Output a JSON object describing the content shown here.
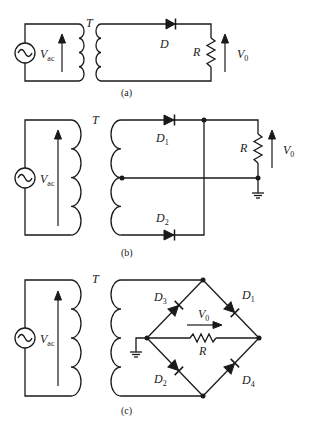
{
  "figure": {
    "panels": [
      {
        "id": "a",
        "caption": "(a)",
        "title": "Half-wave rectifier",
        "labels": {
          "source": "V",
          "source_sub": "ac",
          "transformer": "T",
          "diode": "D",
          "resistor": "R",
          "output": "V",
          "output_sub": "0"
        }
      },
      {
        "id": "b",
        "caption": "(b)",
        "title": "Center-tapped full-wave rectifier",
        "labels": {
          "source": "V",
          "source_sub": "ac",
          "transformer": "T",
          "diode1": "D",
          "diode1_sub": "1",
          "diode2": "D",
          "diode2_sub": "2",
          "resistor": "R",
          "output": "V",
          "output_sub": "0"
        }
      },
      {
        "id": "c",
        "caption": "(c)",
        "title": "Bridge full-wave rectifier",
        "labels": {
          "source": "V",
          "source_sub": "ac",
          "transformer": "T",
          "diode1": "D",
          "diode1_sub": "1",
          "diode2": "D",
          "diode2_sub": "2",
          "diode3": "D",
          "diode3_sub": "3",
          "diode4": "D",
          "diode4_sub": "4",
          "resistor": "R",
          "output": "V",
          "output_sub": "0"
        }
      }
    ]
  }
}
